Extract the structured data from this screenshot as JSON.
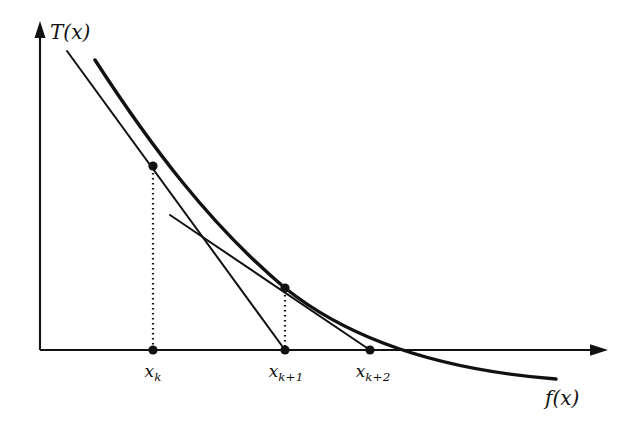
{
  "figure": {
    "type": "diagram",
    "background_color": "#ffffff",
    "ink_color": "#111111"
  },
  "axes": {
    "y_axis": {
      "label": "T(x)",
      "label_base": "T",
      "label_paren_open": "(",
      "label_var": "x",
      "label_paren_close": ")",
      "has_arrow": true,
      "origin_px": [
        40,
        350
      ],
      "tip_px": [
        40,
        22
      ]
    },
    "x_axis": {
      "label": "f(x)",
      "label_base": "f",
      "label_paren_open": "(",
      "label_var": "x",
      "label_paren_close": ")",
      "has_arrow": true,
      "origin_px": [
        40,
        350
      ],
      "tip_px": [
        607,
        350
      ]
    }
  },
  "tick_labels": [
    {
      "name": "x-k",
      "base": "x",
      "sub": "k",
      "text": "x_k",
      "x_px": 153,
      "y_px": 362
    },
    {
      "name": "x-k-1",
      "base": "x",
      "sub": "k+1",
      "text": "x_{k+1}",
      "x_px": 285,
      "y_px": 362
    },
    {
      "name": "x-k-2",
      "base": "x",
      "sub": "k+2",
      "text": "x_{k+2}",
      "x_px": 370,
      "y_px": 362
    }
  ],
  "curve": {
    "name": "function-curve",
    "path": "M 95,60 C 150,145 210,225 285,288 C 350,340 440,370 556,379",
    "stroke_width": 3.4
  },
  "tangent_lines": [
    {
      "name": "tangent-at-x-k",
      "from_px": [
        67,
        51
      ],
      "to_px": [
        285,
        350
      ],
      "touch_point_px": [
        153,
        166
      ]
    },
    {
      "name": "tangent-at-x-k-1",
      "from_px": [
        170,
        215
      ],
      "to_px": [
        370,
        350
      ],
      "touch_point_px": [
        285,
        288
      ]
    }
  ],
  "drop_lines": [
    {
      "name": "drop-line-x-k",
      "x_px": 153,
      "y_top_px": 168,
      "y_bottom_px": 350
    },
    {
      "name": "drop-line-x-k-1",
      "x_px": 285,
      "y_top_px": 290,
      "y_bottom_px": 350
    }
  ],
  "points": [
    {
      "name": "point-curve-x-k",
      "x_px": 153,
      "y_px": 166,
      "r": 4.6
    },
    {
      "name": "point-curve-x-k-1",
      "x_px": 285,
      "y_px": 288,
      "r": 4.6
    },
    {
      "name": "point-axis-x-k",
      "x_px": 153,
      "y_px": 350,
      "r": 4.6
    },
    {
      "name": "point-axis-x-k-1",
      "x_px": 285,
      "y_px": 350,
      "r": 4.6
    },
    {
      "name": "point-axis-x-k-2",
      "x_px": 370,
      "y_px": 350,
      "r": 4.6
    }
  ],
  "label_positions": {
    "y_axis_label": {
      "x_px": 50,
      "y_px": 22
    },
    "x_axis_label": {
      "x_px": 545,
      "y_px": 388
    }
  }
}
